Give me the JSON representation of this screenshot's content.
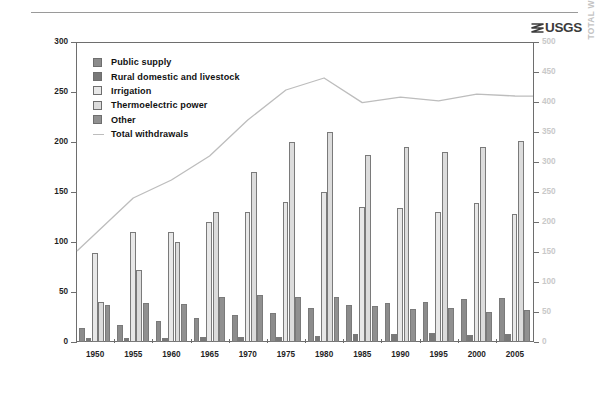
{
  "branding": {
    "logo_text": "USGS",
    "logo_icon": "usgs-wave-icon"
  },
  "axes": {
    "left_title": "WITHDRAWALS, IN BILLION GALLONS PER DAY",
    "right_title": "TOTAL WITHDRAWALS, IN BILLION GALLONS PER DAY",
    "left_ticks": [
      "0",
      "50",
      "100",
      "150",
      "200",
      "250",
      "300"
    ],
    "right_ticks": [
      "0",
      "50",
      "100",
      "150",
      "200",
      "250",
      "300",
      "350",
      "400",
      "450",
      "500"
    ],
    "x_ticks": [
      "1950",
      "1955",
      "1960",
      "1965",
      "1970",
      "1975",
      "1980",
      "1985",
      "1990",
      "1995",
      "2000",
      "2005"
    ]
  },
  "legend": {
    "items": [
      {
        "label": "Public supply",
        "color": "#8c8c8c",
        "type": "swatch"
      },
      {
        "label": "Rural domestic and livestock",
        "color": "#787878",
        "type": "swatch"
      },
      {
        "label": "Irrigation",
        "color": "#e8e8e8",
        "type": "swatch"
      },
      {
        "label": "Thermoelectric power",
        "color": "#dcdcdc",
        "type": "swatch"
      },
      {
        "label": "Other",
        "color": "#909090",
        "type": "swatch"
      },
      {
        "label": "Total withdrawals",
        "color": "#bdbdbd",
        "type": "line"
      }
    ]
  },
  "chart_data": {
    "type": "bar",
    "title": "",
    "xlabel": "",
    "ylabel": "WITHDRAWALS, IN BILLION GALLONS PER DAY",
    "ylabel_right": "TOTAL WITHDRAWALS, IN BILLION GALLONS PER DAY",
    "ylim": [
      0,
      300
    ],
    "ylim_right": [
      0,
      500
    ],
    "grid": false,
    "legend_position": "upper-left-inside",
    "categories": [
      "1950",
      "1955",
      "1960",
      "1965",
      "1970",
      "1975",
      "1980",
      "1985",
      "1990",
      "1995",
      "2000",
      "2005"
    ],
    "series": [
      {
        "name": "Public supply",
        "color": "#8c8c8c",
        "values": [
          14,
          17,
          21,
          24,
          27,
          29,
          34,
          37,
          39,
          40,
          43,
          44
        ]
      },
      {
        "name": "Rural domestic and livestock",
        "color": "#787878",
        "values": [
          4,
          4,
          4,
          5,
          5,
          5,
          6,
          8,
          8,
          9,
          7,
          8
        ]
      },
      {
        "name": "Irrigation",
        "color": "#e8e8e8",
        "values": [
          89,
          110,
          110,
          120,
          130,
          140,
          150,
          135,
          134,
          130,
          139,
          128
        ]
      },
      {
        "name": "Thermoelectric power",
        "color": "#dcdcdc",
        "values": [
          40,
          72,
          100,
          130,
          170,
          200,
          210,
          187,
          195,
          190,
          195,
          201
        ]
      },
      {
        "name": "Other",
        "color": "#909090",
        "values": [
          37,
          39,
          38,
          45,
          47,
          45,
          45,
          36,
          33,
          34,
          30,
          32
        ]
      }
    ],
    "line_series": {
      "name": "Total withdrawals",
      "color": "#bdbdbd",
      "axis": "right",
      "values": [
        180,
        240,
        270,
        310,
        370,
        420,
        440,
        399,
        408,
        402,
        413,
        410
      ]
    }
  }
}
